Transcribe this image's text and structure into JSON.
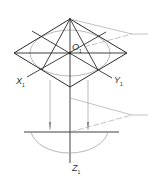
{
  "diagram": {
    "colors": {
      "main_line": "#2a2a2a",
      "thin_line": "#8a8a8a",
      "leader_line": "#9a9a9a",
      "background": "#ffffff"
    },
    "labels": {
      "origin": {
        "main": "O",
        "sub": "1"
      },
      "x_axis": {
        "main": "X",
        "sub": "1"
      },
      "y_axis": {
        "main": "Y",
        "sub": "1"
      },
      "z_axis": {
        "main": "Z",
        "sub": "1"
      }
    },
    "points": {
      "center": [
        70,
        53
      ],
      "rhombus_top": [
        70,
        19
      ],
      "rhombus_left": [
        14,
        53
      ],
      "rhombus_right": [
        127,
        53
      ],
      "rhombus_bottom": [
        70,
        87
      ],
      "leader_top_tip": [
        132,
        34
      ],
      "leader_top_end": [
        148,
        34
      ],
      "leader_bottom_tip": [
        132,
        115
      ],
      "leader_bottom_end": [
        148,
        115
      ],
      "front_view_axis_y": 132,
      "front_view_axis_x": [
        24,
        119
      ],
      "projection_left_x": 50,
      "projection_right_x": 88,
      "semicircle_center": [
        70,
        132
      ],
      "semicircle_rx": 38,
      "semicircle_ry": 25
    }
  }
}
